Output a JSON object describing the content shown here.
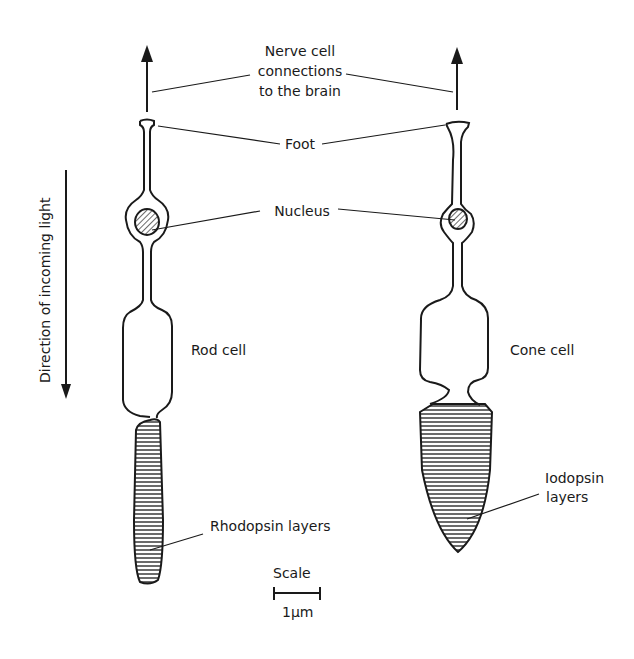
{
  "diagram": {
    "title_lines": [
      "Nerve cell",
      "connections",
      "to the brain"
    ],
    "labels": {
      "foot": "Foot",
      "nucleus": "Nucleus",
      "rod_cell": "Rod cell",
      "cone_cell": "Cone cell",
      "direction": "Direction of incoming light",
      "rhodopsin": "Rhodopsin layers",
      "iodopsin_line1": "Iodopsin",
      "iodopsin_line2": "layers",
      "scale": "Scale",
      "scale_unit": "1µm"
    },
    "colors": {
      "ink": "#1a1a1a",
      "background": "#ffffff"
    }
  }
}
